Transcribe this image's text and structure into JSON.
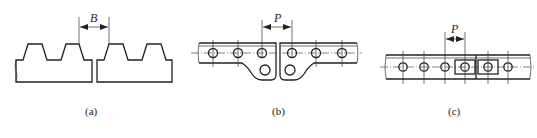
{
  "figure": {
    "panels": [
      {
        "id": "a",
        "caption": "(a)",
        "dimension_label": "B",
        "description": "Two trapezoidal-toothed belt ends butted together, gap dimension B"
      },
      {
        "id": "b",
        "caption": "(b)",
        "dimension_label": "P",
        "description": "Perforated strip ends with bent lug joint, pitch P between holes"
      },
      {
        "id": "c",
        "caption": "(c)",
        "dimension_label": "P",
        "description": "Perforated strip with overlapping rectangular clamp plates, pitch P"
      }
    ],
    "colors": {
      "line": "#222222",
      "background": "#ffffff"
    }
  }
}
